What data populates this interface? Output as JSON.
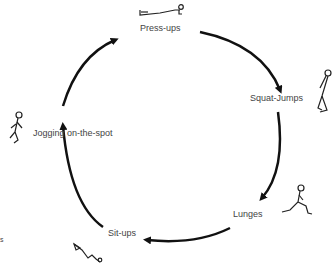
{
  "diagram": {
    "title": "",
    "type": "circuit-cycle",
    "stations": [
      {
        "label": "Press-ups",
        "icon": "press-up-figure-icon"
      },
      {
        "label": "Squat-Jumps",
        "icon": "squat-jump-figure-icon"
      },
      {
        "label": "Lunges",
        "icon": "lunge-figure-icon"
      },
      {
        "label": "Sit-ups",
        "icon": "sit-up-figure-icon"
      },
      {
        "label": "Jogging on-the-spot",
        "icon": "jogging-figure-icon"
      }
    ],
    "edge_marks": {
      "left": "s"
    },
    "colors": {
      "arrow": "#111111",
      "label": "#444444",
      "background": "#ffffff"
    }
  }
}
